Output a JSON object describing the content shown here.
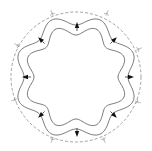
{
  "diagram": {
    "type": "octagonal-wavy-band-in-circle",
    "center": [
      76,
      77
    ],
    "outer_circle": {
      "radius": 65,
      "style": "dashed",
      "color": "#8a8a8a"
    },
    "outer_wavy_curve": {
      "lobes": 8,
      "base_radius": 57,
      "amplitude": 5,
      "color": "#555555"
    },
    "inner_wavy_curve": {
      "lobes": 8,
      "base_radius": 47,
      "amplitude": 5,
      "color": "#555555"
    },
    "inner_arrows": {
      "count": 8,
      "color": "#111111",
      "positions": [
        {
          "x": 77,
          "y": 26,
          "dir": "up"
        },
        {
          "x": 114,
          "y": 40,
          "dir": "up-right"
        },
        {
          "x": 130,
          "y": 77,
          "dir": "right"
        },
        {
          "x": 114,
          "y": 115,
          "dir": "down-right"
        },
        {
          "x": 77,
          "y": 133,
          "dir": "down"
        },
        {
          "x": 41,
          "y": 115,
          "dir": "down-left"
        },
        {
          "x": 26,
          "y": 77,
          "dir": "left"
        },
        {
          "x": 41,
          "y": 40,
          "dir": "up-left"
        }
      ]
    },
    "outer_markers": {
      "count": 8,
      "color": "#9a9a9a",
      "positions": [
        {
          "x": 52,
          "y": 13
        },
        {
          "x": 107,
          "y": 13
        },
        {
          "x": 139,
          "y": 49
        },
        {
          "x": 138,
          "y": 102
        },
        {
          "x": 104,
          "y": 140
        },
        {
          "x": 52,
          "y": 140
        },
        {
          "x": 14,
          "y": 100
        },
        {
          "x": 17,
          "y": 45
        }
      ]
    }
  }
}
